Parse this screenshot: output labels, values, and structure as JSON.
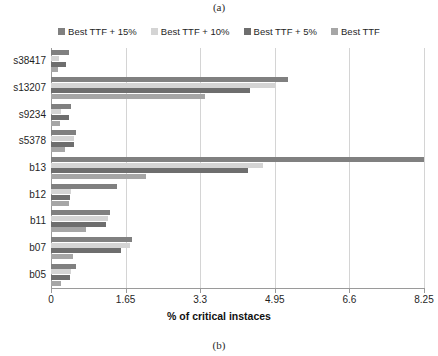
{
  "figure": {
    "caption_top": "(a)",
    "caption_bottom": "(b)"
  },
  "legend": {
    "position": "top-center",
    "items": [
      {
        "label": "Best TTF + 15%",
        "color": "#808080"
      },
      {
        "label": "Best TTF + 10%",
        "color": "#d4d4d4"
      },
      {
        "label": "Best TTF + 5%",
        "color": "#6e6e6e"
      },
      {
        "label": "Best TTF",
        "color": "#a6a6a6"
      }
    ]
  },
  "chart_data": {
    "type": "bar",
    "orientation": "horizontal",
    "title": "",
    "xlabel": "% of critical instaces",
    "ylabel": "",
    "xlim": [
      0,
      8.25
    ],
    "xticks": [
      "0",
      "1.65",
      "3.3",
      "4.95",
      "6.6",
      "8.25"
    ],
    "xtick_values": [
      0,
      1.65,
      3.3,
      4.95,
      6.6,
      8.25
    ],
    "grid": true,
    "categories": [
      "s38417",
      "s13207",
      "s9234",
      "s5378",
      "b13",
      "b12",
      "b11",
      "b07",
      "b05"
    ],
    "series": [
      {
        "name": "Best TTF + 15%",
        "color": "#808080",
        "values": [
          0.4,
          5.25,
          0.45,
          0.55,
          8.25,
          1.45,
          1.3,
          1.8,
          0.55
        ]
      },
      {
        "name": "Best TTF + 10%",
        "color": "#d4d4d4",
        "values": [
          0.18,
          4.95,
          0.22,
          0.5,
          4.7,
          0.45,
          1.25,
          1.75,
          0.45
        ]
      },
      {
        "name": "Best TTF + 5%",
        "color": "#6e6e6e",
        "values": [
          0.34,
          4.4,
          0.4,
          0.5,
          4.35,
          0.42,
          1.22,
          1.55,
          0.42
        ]
      },
      {
        "name": "Best TTF",
        "color": "#a6a6a6",
        "values": [
          0.16,
          3.4,
          0.2,
          0.3,
          2.1,
          0.4,
          0.78,
          0.48,
          0.22
        ]
      }
    ]
  }
}
